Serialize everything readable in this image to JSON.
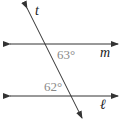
{
  "diagram": {
    "type": "parallel-lines-transversal",
    "lines": {
      "m": {
        "label": "m",
        "y": 44,
        "x1": 10,
        "x2": 118
      },
      "l": {
        "label": "ℓ",
        "y": 96,
        "x1": 10,
        "x2": 118
      },
      "t": {
        "label": "t",
        "x1": 27,
        "y1": 8,
        "x2": 82,
        "y2": 118
      }
    },
    "angles": [
      {
        "name": "angle-at-m",
        "value": "63°",
        "position": "below m, right of t"
      },
      {
        "name": "angle-at-l",
        "value": "62°",
        "position": "above ℓ, left of t"
      }
    ],
    "colors": {
      "line": "#333333",
      "angle_text": "#8a8a8a",
      "variable_text": "#222222"
    }
  }
}
